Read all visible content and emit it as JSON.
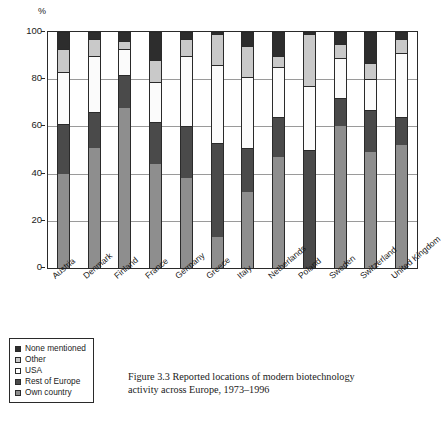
{
  "figure": {
    "caption_line1": "Figure 3.3 Reported locations of modern biotechnology",
    "caption_line2": "activity across Europe, 1973–1996"
  },
  "legend": {
    "items": [
      {
        "label": "None mentioned",
        "key": "none",
        "color": "#2d2d2d"
      },
      {
        "label": "Other",
        "key": "other",
        "color": "#c9c9c9"
      },
      {
        "label": "USA",
        "key": "usa",
        "color": "#ffffff"
      },
      {
        "label": "Rest of Europe",
        "key": "rest",
        "color": "#4a4a4a"
      },
      {
        "label": "Own country",
        "key": "own",
        "color": "#8e8e8e"
      }
    ]
  },
  "chart_data": {
    "type": "bar",
    "subtype": "stacked-100-percent",
    "title": "",
    "xlabel": "",
    "ylabel": "%",
    "ylim": [
      0,
      100
    ],
    "yticks": [
      0,
      20,
      40,
      60,
      80,
      100
    ],
    "ytick_labels": [
      "0",
      "20",
      "40",
      "60",
      "80",
      "100"
    ],
    "grid": true,
    "legend_position": "below-left",
    "categories": [
      "Austria",
      "Denmark",
      "Finland",
      "France",
      "Germany",
      "Greece",
      "Italy",
      "Netherlands",
      "Poland",
      "Sweden",
      "Switzerland",
      "United Kingdom"
    ],
    "series": [
      {
        "name": "Own country",
        "color": "#8e8e8e",
        "values": [
          40,
          51,
          68,
          44,
          38,
          13,
          32,
          47,
          0,
          60,
          49,
          52
        ]
      },
      {
        "name": "Rest of Europe",
        "color": "#4a4a4a",
        "values": [
          21,
          15,
          14,
          18,
          22,
          40,
          19,
          17,
          50,
          12,
          18,
          12
        ]
      },
      {
        "name": "USA",
        "color": "#fbfbfb",
        "values": [
          22,
          24,
          11,
          17,
          30,
          33,
          30,
          21,
          27,
          17,
          13,
          27
        ]
      },
      {
        "name": "Other",
        "color": "#c9c9c9",
        "values": [
          10,
          7,
          3,
          9,
          7,
          13,
          13,
          5,
          22,
          6,
          7,
          6
        ]
      },
      {
        "name": "None mentioned",
        "color": "#2d2d2d",
        "values": [
          7,
          3,
          4,
          12,
          3,
          1,
          6,
          10,
          1,
          5,
          13,
          3
        ]
      }
    ],
    "cumulative_tops": {
      "Austria": {
        "own": 40,
        "rest": 61,
        "usa": 83,
        "other": 93,
        "none": 100
      },
      "Denmark": {
        "own": 51,
        "rest": 66,
        "usa": 90,
        "other": 97,
        "none": 100
      },
      "Finland": {
        "own": 68,
        "rest": 82,
        "usa": 93,
        "other": 96,
        "none": 100
      },
      "France": {
        "own": 44,
        "rest": 62,
        "usa": 79,
        "other": 88,
        "none": 100
      },
      "Germany": {
        "own": 38,
        "rest": 60,
        "usa": 90,
        "other": 97,
        "none": 100
      },
      "Greece": {
        "own": 13,
        "rest": 53,
        "usa": 86,
        "other": 99,
        "none": 100
      },
      "Italy": {
        "own": 32,
        "rest": 51,
        "usa": 81,
        "other": 94,
        "none": 100
      },
      "Netherlands": {
        "own": 47,
        "rest": 64,
        "usa": 85,
        "other": 90,
        "none": 100
      },
      "Poland": {
        "own": 0,
        "rest": 50,
        "usa": 77,
        "other": 99,
        "none": 100
      },
      "Sweden": {
        "own": 60,
        "rest": 72,
        "usa": 89,
        "other": 95,
        "none": 100
      },
      "Switzerland": {
        "own": 49,
        "rest": 67,
        "usa": 80,
        "other": 87,
        "none": 100
      },
      "United Kingdom": {
        "own": 52,
        "rest": 64,
        "usa": 91,
        "other": 97,
        "none": 100
      }
    }
  }
}
